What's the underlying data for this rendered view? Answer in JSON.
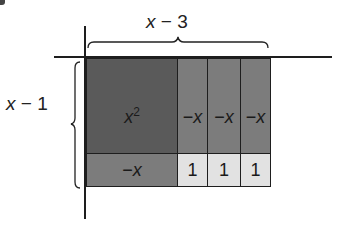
{
  "figure": {
    "top_label": {
      "var": "x",
      "op": " − ",
      "num": "3"
    },
    "left_label": {
      "var": "x",
      "op": " − ",
      "num": "1"
    },
    "tiles": {
      "x_squared": {
        "base": "x",
        "exp": "2",
        "color": "#5a5a5a"
      },
      "neg_x_cols": [
        {
          "sign": "−",
          "var": "x"
        },
        {
          "sign": "−",
          "var": "x"
        },
        {
          "sign": "−",
          "var": "x"
        }
      ],
      "neg_x_row": {
        "sign": "−",
        "var": "x"
      },
      "ones": [
        {
          "value": "1"
        },
        {
          "value": "1"
        },
        {
          "value": "1"
        }
      ]
    },
    "colors": {
      "x_squared": "#5a5a5a",
      "neg_x": "#7c7c7c",
      "one": "#e2e2e2",
      "line": "#1e1e1e"
    }
  }
}
